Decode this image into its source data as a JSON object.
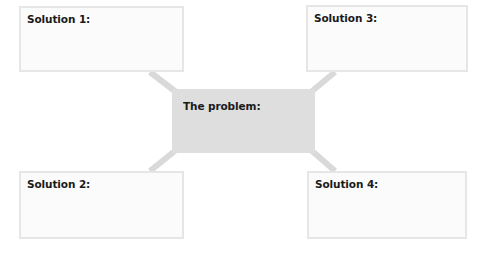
{
  "diagram": {
    "type": "mind-map",
    "center": {
      "label": "The problem:"
    },
    "nodes": [
      {
        "id": "solution-1",
        "label": "Solution 1:",
        "position": "top-left"
      },
      {
        "id": "solution-2",
        "label": "Solution 2:",
        "position": "bottom-left"
      },
      {
        "id": "solution-3",
        "label": "Solution 3:",
        "position": "top-right"
      },
      {
        "id": "solution-4",
        "label": "Solution 4:",
        "position": "bottom-right"
      }
    ],
    "colors": {
      "center_fill": "#dedede",
      "box_fill": "#fbfbfb",
      "box_border": "#e6e6e6",
      "connector": "#d9d9d9",
      "text": "#1a1a1a"
    }
  }
}
